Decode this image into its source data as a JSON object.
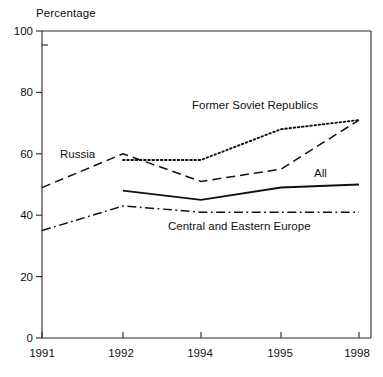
{
  "chart_data": {
    "type": "line",
    "title": "",
    "xlabel": "",
    "ylabel": "Percentage",
    "categories": [
      "1991",
      "1992",
      "1994",
      "1995",
      "1998"
    ],
    "ylim": [
      0,
      100
    ],
    "yticks": [
      0,
      20,
      40,
      60,
      80,
      100
    ],
    "ytick_labels": [
      "0",
      "20",
      "40",
      "60",
      "80",
      "100"
    ],
    "grid": false,
    "legend_position": "inline-annotations",
    "series": [
      {
        "name": "Former Soviet Republics",
        "style": "dotted",
        "x": [
          "1992",
          "1994",
          "1995",
          "1998"
        ],
        "values": [
          58,
          58,
          68,
          71
        ]
      },
      {
        "name": "Russia",
        "style": "dashed",
        "x": [
          "1991",
          "1992",
          "1994",
          "1995",
          "1998"
        ],
        "values": [
          49,
          60,
          51,
          55,
          71
        ]
      },
      {
        "name": "All",
        "style": "solid",
        "x": [
          "1992",
          "1994",
          "1995",
          "1998"
        ],
        "values": [
          48,
          45,
          49,
          50
        ]
      },
      {
        "name": "Central and Eastern Europe",
        "style": "dash-dot",
        "x": [
          "1991",
          "1992",
          "1994",
          "1995",
          "1998"
        ],
        "values": [
          35,
          43,
          41,
          41,
          41
        ]
      }
    ],
    "annotations": [
      {
        "text": "Former Soviet Republics",
        "x": 192,
        "y": 100
      },
      {
        "text": "Russia",
        "x": 60,
        "y": 149
      },
      {
        "text": "All",
        "x": 314,
        "y": 168
      },
      {
        "text": "Central and Eastern Europe",
        "x": 168,
        "y": 221
      }
    ],
    "colors": {
      "line": "#111111",
      "axis": "#262626",
      "background": "#ffffff"
    }
  }
}
